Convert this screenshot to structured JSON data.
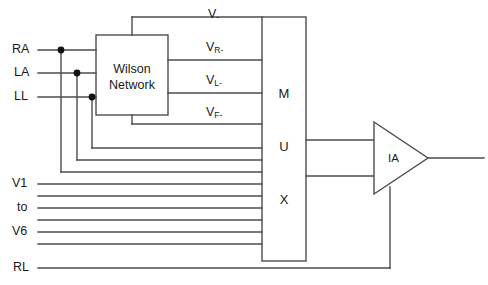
{
  "diagram": {
    "stroke_color": "#4d4d4d",
    "text_color": "#1a1a1a",
    "background": "#ffffff",
    "electrode_inputs": [
      {
        "label": "RA",
        "name": "electrode-ra"
      },
      {
        "label": "LA",
        "name": "electrode-la"
      },
      {
        "label": "LL",
        "name": "electrode-ll"
      }
    ],
    "chest_inputs": [
      {
        "label": "V1",
        "name": "chest-lead-v1"
      },
      {
        "label": "to",
        "name": "chest-lead-range"
      },
      {
        "label": "V6",
        "name": "chest-lead-v6"
      }
    ],
    "reference_input": {
      "label": "RL",
      "name": "reference-rl"
    },
    "wilson": {
      "line1": "Wilson",
      "line2": "Network"
    },
    "wilson_outputs": [
      {
        "base": "V",
        "sub": "",
        "sign": "-",
        "name": "signal-v-minus"
      },
      {
        "base": "V",
        "sub": "R",
        "sign": "-",
        "name": "signal-vr-minus"
      },
      {
        "base": "V",
        "sub": "L",
        "sign": "-",
        "name": "signal-vl-minus"
      },
      {
        "base": "V",
        "sub": "F",
        "sign": "-",
        "name": "signal-vf-minus"
      }
    ],
    "mux": {
      "letters": [
        "M",
        "U",
        "X"
      ],
      "name": "multiplexer-block"
    },
    "amplifier": {
      "label": "IA",
      "name": "instrumentation-amplifier"
    }
  }
}
